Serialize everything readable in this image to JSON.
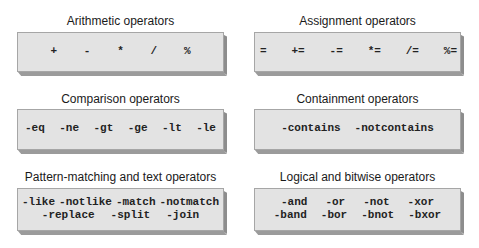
{
  "groups": [
    {
      "title": "Arithmetic operators",
      "rows": [
        [
          "+",
          "-",
          "*",
          "/",
          "%"
        ]
      ]
    },
    {
      "title": "Assignment operators",
      "rows": [
        [
          "=",
          "+=",
          "-=",
          "*=",
          "/=",
          "%="
        ]
      ]
    },
    {
      "title": "Comparison operators",
      "rows": [
        [
          "-eq",
          "-ne",
          "-gt",
          "-ge",
          "-lt",
          "-le"
        ]
      ]
    },
    {
      "title": "Containment operators",
      "rows": [
        [
          "-contains",
          "-notcontains"
        ]
      ]
    },
    {
      "title": "Pattern-matching and text operators",
      "rows": [
        [
          "-like",
          "-notlike",
          "-match",
          "-notmatch"
        ],
        [
          "-replace",
          "-split",
          "-join"
        ]
      ]
    },
    {
      "title": "Logical and bitwise operators",
      "rows": [
        [
          "-and",
          "-or",
          "-not",
          "-xor"
        ],
        [
          "-band",
          "-bor",
          "-bnot",
          "-bxor"
        ]
      ]
    }
  ],
  "colors": {
    "box_face": "#e3e3e3",
    "box_side": "#8d8d8d",
    "box_bottom": "#9b9b9b",
    "text": "#222222"
  }
}
